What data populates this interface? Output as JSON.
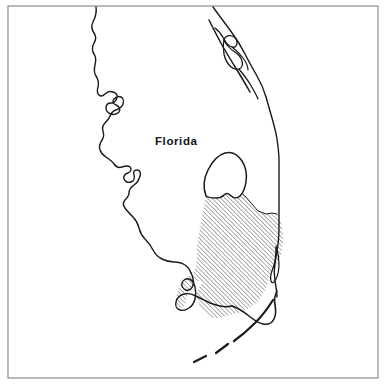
{
  "figure": {
    "kind": "line-art-map",
    "background_color": "#ffffff",
    "frame": {
      "name": "figure-border",
      "color": "#8e8e8e",
      "stroke_width": 1.2,
      "x": 8,
      "y": 6,
      "width": 370,
      "height": 372
    }
  },
  "labels": [
    {
      "id": "florida",
      "text": "Florida",
      "x": 155,
      "y": 145,
      "bold": true,
      "color": "#141414"
    }
  ],
  "map": {
    "coastline_color": "#1a1a1a",
    "coastline_width": 1.3,
    "hatch": {
      "name": "study-area-hatch",
      "color": "#1a1a1a",
      "angle_degrees": 45,
      "spacing_px": 3.1,
      "line_width": 0.65,
      "description": "Diagonal hatching over the South Florida study region"
    },
    "features": [
      {
        "id": "west-coast",
        "label": "Gulf of Mexico coastline",
        "type": "coastline"
      },
      {
        "id": "east-coast",
        "label": "Atlantic coastline",
        "type": "coastline"
      },
      {
        "id": "tampa-bay",
        "label": "Tampa Bay estuary",
        "type": "bay"
      },
      {
        "id": "charlotte-harbor",
        "label": "Charlotte Harbor",
        "type": "bay"
      },
      {
        "id": "indian-river-lagoon",
        "label": "Indian River barrier island system",
        "type": "lagoon"
      },
      {
        "id": "lake-okeechobee",
        "label": "Lake Okeechobee",
        "type": "lake",
        "filled": false
      },
      {
        "id": "whitewater-bay",
        "label": "Whitewater Bay / Cape Sable",
        "type": "bay",
        "filled": false
      },
      {
        "id": "study-area",
        "label": "South Florida hatched study area",
        "type": "region",
        "hatched": true
      },
      {
        "id": "florida-keys",
        "label": "Florida Keys",
        "type": "island-chain",
        "style": "dashed-arc"
      }
    ]
  }
}
